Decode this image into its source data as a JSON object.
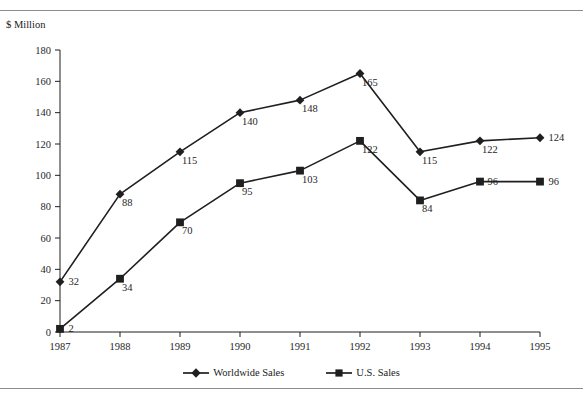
{
  "figure": {
    "title": "Figure 1. Worldwide and U.S. Sales (Clipped at top of image)",
    "unit_caption": "$ Million",
    "ink_color": "#1f1f1f",
    "rule_color": "#8d8d8d"
  },
  "legend": {
    "position": "bottom-center",
    "items": [
      {
        "label": "Worldwide Sales",
        "marker": "diamond-marker"
      },
      {
        "label": "U.S. Sales",
        "marker": "square-marker"
      }
    ]
  },
  "chart_data": {
    "type": "line",
    "title": "",
    "xlabel": "",
    "ylabel": "$ Million",
    "x": [
      "1987",
      "1988",
      "1989",
      "1990",
      "1991",
      "1992",
      "1993",
      "1994",
      "1995"
    ],
    "categories": [
      "1987",
      "1988",
      "1989",
      "1990",
      "1991",
      "1992",
      "1993",
      "1994",
      "1995"
    ],
    "ylim": [
      0,
      180
    ],
    "yticks": [
      0,
      20,
      40,
      60,
      80,
      100,
      120,
      140,
      160,
      180
    ],
    "grid": false,
    "series": [
      {
        "name": "Worldwide Sales",
        "marker": "diamond",
        "color": "#1f1f1f",
        "values": [
          32,
          88,
          115,
          140,
          148,
          165,
          115,
          122,
          124
        ],
        "labels": [
          "32",
          "88",
          "115",
          "140",
          "148",
          "165",
          "115",
          "122",
          "124"
        ]
      },
      {
        "name": "U.S. Sales",
        "marker": "square",
        "color": "#1f1f1f",
        "values": [
          2,
          34,
          70,
          95,
          103,
          122,
          84,
          96,
          96
        ],
        "labels": [
          "2",
          "34",
          "70",
          "95",
          "103",
          "122",
          "84",
          "96",
          "96"
        ]
      }
    ]
  }
}
